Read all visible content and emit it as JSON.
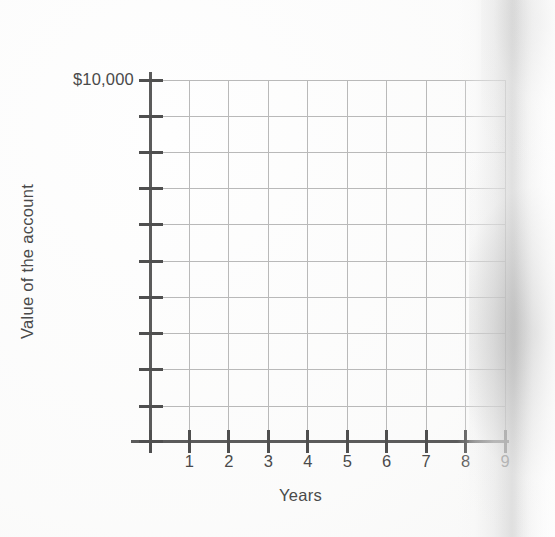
{
  "chart_data": {
    "type": "line",
    "title": "",
    "subtitle": "",
    "xlabel": "Years",
    "ylabel": "Value of the account",
    "x_tick_labels": [
      "1",
      "2",
      "3",
      "4",
      "5",
      "6",
      "7",
      "8",
      "9"
    ],
    "x_tick_values": [
      1,
      2,
      3,
      4,
      5,
      6,
      7,
      8,
      9
    ],
    "y_tick_labels": [
      "$10,000",
      "",
      "",
      "",
      "",
      "",
      "",
      "",
      "",
      ""
    ],
    "y_top_label": "$10,000",
    "xlim": [
      0,
      9
    ],
    "ylim": [
      0,
      10000
    ],
    "grid": true,
    "grid_vertical_count": 9,
    "grid_horizontal_count": 10,
    "legend": null,
    "legend_position": "none",
    "series": [],
    "annotations": [],
    "colors": {
      "axis": "#5b5b5b",
      "tick": "#4f4f4f",
      "gridline": "#b9b9b9",
      "text": "#4a4a4a",
      "background": "#ffffff"
    }
  },
  "figure": {
    "background_color": "#ffffff",
    "axis_color": "#5b5b5b",
    "grid_color": "#b9b9b9",
    "text_color": "#4a4a4a",
    "x_axis_title": "Years",
    "y_axis_title": "Value of the account",
    "y_axis_top_tick_label": "$10,000",
    "x_axis_tick_labels": [
      "1",
      "2",
      "3",
      "4",
      "5",
      "6",
      "7",
      "8",
      "9"
    ],
    "scan_artifact": "page-edge-shadow"
  }
}
